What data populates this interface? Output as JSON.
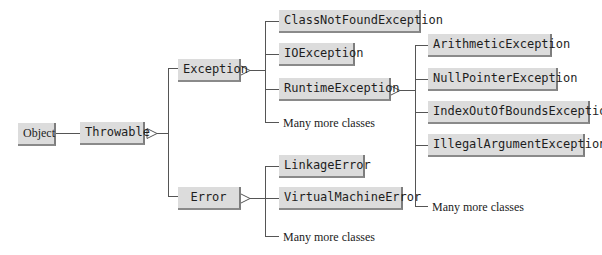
{
  "diagram": {
    "type": "class-hierarchy",
    "root": {
      "label": "Object"
    },
    "throwable": {
      "label": "Throwable"
    },
    "exception": {
      "label": "Exception",
      "children": [
        {
          "label": "ClassNotFoundException"
        },
        {
          "label": "IOException"
        },
        {
          "label": "RuntimeException"
        }
      ],
      "more_label": "Many more classes"
    },
    "runtime_exception": {
      "children": [
        {
          "label": "ArithmeticException"
        },
        {
          "label": "NullPointerException"
        },
        {
          "label": "IndexOutOfBoundsException"
        },
        {
          "label": "IllegalArgumentException"
        }
      ],
      "more_label": "Many more classes"
    },
    "error": {
      "label": "Error",
      "children": [
        {
          "label": "LinkageError"
        },
        {
          "label": "VirtualMachineError"
        }
      ],
      "more_label": "Many more classes"
    },
    "colors": {
      "box_fill": "#dcdcdc",
      "box_shadow": "#7d7d7d",
      "line": "#555555",
      "text": "#1e1e1e"
    }
  }
}
